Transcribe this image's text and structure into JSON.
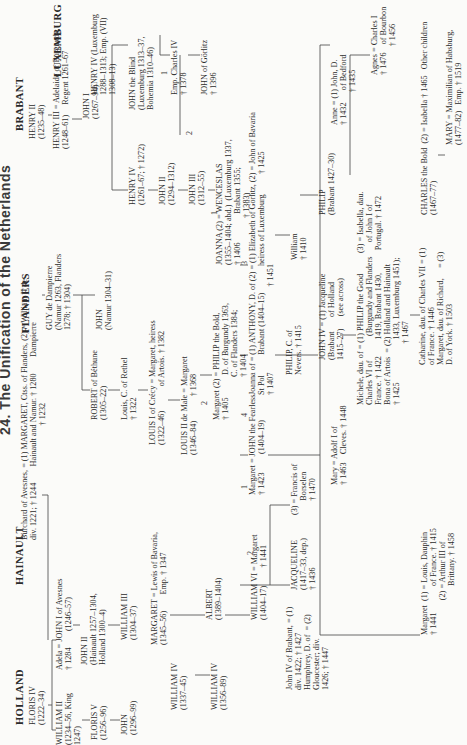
{
  "title": "24. The Unification of the Netherlands",
  "houses": [
    {
      "id": "holland",
      "label": "HOLLAND",
      "x": 10,
      "y": 14
    },
    {
      "id": "hainault",
      "label": "HAINAULT",
      "x": 150,
      "y": 14
    },
    {
      "id": "flanders",
      "label": "FLANDERS",
      "x": 402,
      "y": 20
    },
    {
      "id": "brabant",
      "label": "BRABANT",
      "x": 604,
      "y": 14
    },
    {
      "id": "luxemburg",
      "label": "LUXEMBURG",
      "x": 658,
      "y": 52
    }
  ],
  "nodes": [
    {
      "id": "floris4",
      "text": "FLORIS IV\n(1222–34)",
      "x": 10,
      "y": 28
    },
    {
      "id": "william2",
      "text": "WILLIAM II\n(1234–56, King\n1247)",
      "x": -10,
      "y": 55
    },
    {
      "id": "adela",
      "text": "Adela = JOHN I of Avesnes\n† 1284        (1246–57)",
      "x": 65,
      "y": 55
    },
    {
      "id": "floris5",
      "text": "FLORIS V\n(1256–96)",
      "x": -5,
      "y": 90
    },
    {
      "id": "john2hain",
      "text": "JOHN II\n(Hainault 1257–1304,\nHolland 1300–4)",
      "x": 70,
      "y": 80
    },
    {
      "id": "johnholl",
      "text": "JOHN\n(1296–99)",
      "x": 0,
      "y": 120
    },
    {
      "id": "william3",
      "text": "WILLIAM III\n(1304–37)",
      "x": 95,
      "y": 120
    },
    {
      "id": "burchard",
      "text": "Burchard of Avesnes, = (1) MARGARET, Ctss. of Flanders, (2) = William II de\ndiv. 1221; † 1244        Hainault and Namur. † 1280        Dampierre\n                                                        † 1232",
      "x": 195,
      "y": 20
    },
    {
      "id": "guy",
      "text": "GUY de Dampierre\n(Namur 1263, Flanders\n1278; † 1304)",
      "x": 405,
      "y": 45
    },
    {
      "id": "robert",
      "text": "ROBERT of Béthune\n(1305–22)",
      "x": 315,
      "y": 90
    },
    {
      "id": "johnnamur",
      "text": "JOHN\n(Namur 1304–31)",
      "x": 405,
      "y": 95
    },
    {
      "id": "louisrethel",
      "text": "Louis, C. of Rethel\n† 1322",
      "x": 315,
      "y": 120
    },
    {
      "id": "louis1",
      "text": "LOUIS I of Crécy = Margaret, heiress\n(1322–46)            of Artois. † 1382",
      "x": 290,
      "y": 148
    },
    {
      "id": "louis2",
      "text": "LOUIS II de Male = Margaret\n(1346–84)            † 1368",
      "x": 280,
      "y": 180
    },
    {
      "id": "margaret2",
      "text": "Margaret (2) = PHILIP the Bold,\n† 1405           D. of Burgundy 1363,\n                     C. of Flanders 1384;\n                     † 1404",
      "x": 315,
      "y": 212
    },
    {
      "id": "henry2",
      "text": "HENRY II\n(1235–48)",
      "x": 596,
      "y": 28
    },
    {
      "id": "henry3",
      "text": "HENRY III = Adelaide of Burgundy,\n(1248–61)     Regent 1261–67",
      "x": 586,
      "y": 52
    },
    {
      "id": "henry4lux",
      "text": "HENRY IV (Luxemburg\n1288–1313; Emp. (VII)\n1308–13)",
      "x": 640,
      "y": 90
    },
    {
      "id": "john1brab",
      "text": "JOHN I\n(1267–94)",
      "x": 616,
      "y": 82
    },
    {
      "id": "johnblind",
      "text": "JOHN the Blind\n(Luxemburg 1313–37,\nBohemia 1310–46)",
      "x": 625,
      "y": 128
    },
    {
      "id": "henry4brab",
      "text": "HENRY IV\n(1261–67; † 1272)",
      "x": 530,
      "y": 128
    },
    {
      "id": "john2brab",
      "text": "JOHN II\n(1294–1312)",
      "x": 530,
      "y": 158
    },
    {
      "id": "john3brab",
      "text": "JOHN III\n(1312–55)",
      "x": 530,
      "y": 188
    },
    {
      "id": "charles4",
      "text": "Emp. Charles IV\n† 1378",
      "x": 640,
      "y": 170
    },
    {
      "id": "joanna",
      "text": "JOANNA (2) = WENCESLAS\n(1355–1404; abd.)  (Luxemburg 1337,\n† 1406              Brabant 1355;\n                       † 1383)",
      "x": 470,
      "y": 215
    },
    {
      "id": "johngorlitz",
      "text": "JOHN of Görlitz\n† 1396",
      "x": 640,
      "y": 200
    },
    {
      "id": "johnfearless",
      "text": "Margaret = JOHN the Fearless\n† 1423         (1404–19)",
      "x": 240,
      "y": 248
    },
    {
      "id": "joannastpol",
      "text": "Joanna of = (1) ANTHONY, D. of (2) = (1) Elizabeth of Görlitz, (2) = John of Bavaria\nSt Pol          Brabant (1404–15)             heiress of Luxemburg          † 1425\n† 1407                                          † 1451",
      "x": 340,
      "y": 248
    },
    {
      "id": "philipnevers",
      "text": "PHILIP, C. of\nNevers. † 1415",
      "x": 360,
      "y": 285
    },
    {
      "id": "williambrab",
      "text": "William\n† 1410",
      "x": 475,
      "y": 290
    },
    {
      "id": "margaretbav",
      "text": "MARGARET = Lewis of Bavaria,\n(1345–56)        Emp. † 1347",
      "x": 90,
      "y": 150
    },
    {
      "id": "william4a",
      "text": "WILLIAM IV\n(1337–45)",
      "x": 25,
      "y": 170
    },
    {
      "id": "william4b",
      "text": "WILLIAM IV\n(1356–89)",
      "x": 25,
      "y": 210
    },
    {
      "id": "albert",
      "text": "ALBERT\n(1389–1404)",
      "x": 115,
      "y": 205
    },
    {
      "id": "william6",
      "text": "WILLIAM VI = Margaret\n(1404–17)         † 1441",
      "x": 115,
      "y": 250
    },
    {
      "id": "jacqueline",
      "text": "JACQUELINE\n(1417–33, dep.)\n† 1436",
      "x": 145,
      "y": 290
    },
    {
      "id": "johniv_text",
      "text": "John IV of Brabant, = (1)\ndiv. 1422; † 1427\nHumphrey, D. of  = (2)\nGloucester; div.\n1426; † 1447",
      "x": 45,
      "y": 285
    },
    {
      "id": "borselen",
      "text": "(3) = Francis of\n       Borselen\n       † 1470",
      "x": 220,
      "y": 290
    },
    {
      "id": "johniv",
      "text": "JOHN IV = (1) Jacqueline\n(Brabant       of Holland\n1415–27)      (see across)",
      "x": 375,
      "y": 318
    },
    {
      "id": "philipbrab",
      "text": "PHILIP\n(Brabant 1427–30)",
      "x": 520,
      "y": 318
    },
    {
      "id": "marycleves",
      "text": "Mary = Adolf I of\n† 1463    Cleves. † 1448",
      "x": 250,
      "y": 330
    },
    {
      "id": "michele",
      "text": "Michele, dau. of = (1) PHILIP the Good          (3) = Isabella, dau.\nCharles VI of            (Burgundy and Flanders       of John I of\nFrance. † 1422        1419, Brabant 1430,           Portugal. † 1472\nBona of Artois  = (2) Holland and Hainault\n† 1425                     1433, Luxemburg 1451);\n                              † 1467",
      "x": 330,
      "y": 356
    },
    {
      "id": "anne",
      "text": "Anne = (1) John, D.\n† 1432      of Bedford\n                † 1435",
      "x": 610,
      "y": 330
    },
    {
      "id": "agnes",
      "text": "Agnes = Charles I\n† 1476    of Bourbon\n              † 1456",
      "x": 660,
      "y": 370
    },
    {
      "id": "catharine",
      "text": "Catharine, dau. of Charles VII = (1)\nof France. † 1446\nMargaret, dau. of Richard,     = (3)\nD. of York. † 1503",
      "x": 370,
      "y": 418
    },
    {
      "id": "charlesbold",
      "text": "CHARLES the Bold  (2) = Isabella † 1465   Other children\n(1467–77)",
      "x": 520,
      "y": 420
    },
    {
      "id": "mary",
      "text": "MARY = Maximilian of Habsburg,\n(1477–82)   Emp. † 1519",
      "x": 590,
      "y": 445
    },
    {
      "id": "margaretdauphin",
      "text": "Margaret  (1) = Louis, Dauphin\n† 1441             of France. † 1415\n                 (2) = Arthur III of\n                        Brittany. † 1458",
      "x": 100,
      "y": 420
    }
  ],
  "numbers": [
    {
      "t": "1",
      "x": 246,
      "y": 240
    },
    {
      "t": "2",
      "x": 180,
      "y": 246
    },
    {
      "t": "3",
      "x": 470,
      "y": 240
    },
    {
      "t": "4",
      "x": 318,
      "y": 240
    },
    {
      "t": "1",
      "x": 660,
      "y": 160
    },
    {
      "t": "2",
      "x": 600,
      "y": 185
    },
    {
      "t": "1",
      "x": 520,
      "y": 210
    },
    {
      "t": "2",
      "x": 330,
      "y": 200
    }
  ]
}
